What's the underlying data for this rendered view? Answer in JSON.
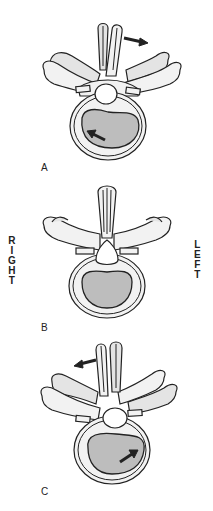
{
  "figure": {
    "panels": [
      {
        "id": "A",
        "letter": "A",
        "rotation": "rotated",
        "spinous_arrow": "right",
        "body_arrow": "up-left"
      },
      {
        "id": "B",
        "letter": "B",
        "rotation": "neutral"
      },
      {
        "id": "C",
        "letter": "C",
        "rotation": "rotated",
        "spinous_arrow": "left",
        "body_arrow": "up-right"
      }
    ],
    "side_labels": {
      "right": [
        "R",
        "I",
        "G",
        "H",
        "T"
      ],
      "left": [
        "L",
        "E",
        "F",
        "T"
      ]
    },
    "colors": {
      "background": "#ffffff",
      "bone_fill": "#f2f2f2",
      "disc_fill": "#bdbdbd",
      "outline": "#222222"
    }
  }
}
